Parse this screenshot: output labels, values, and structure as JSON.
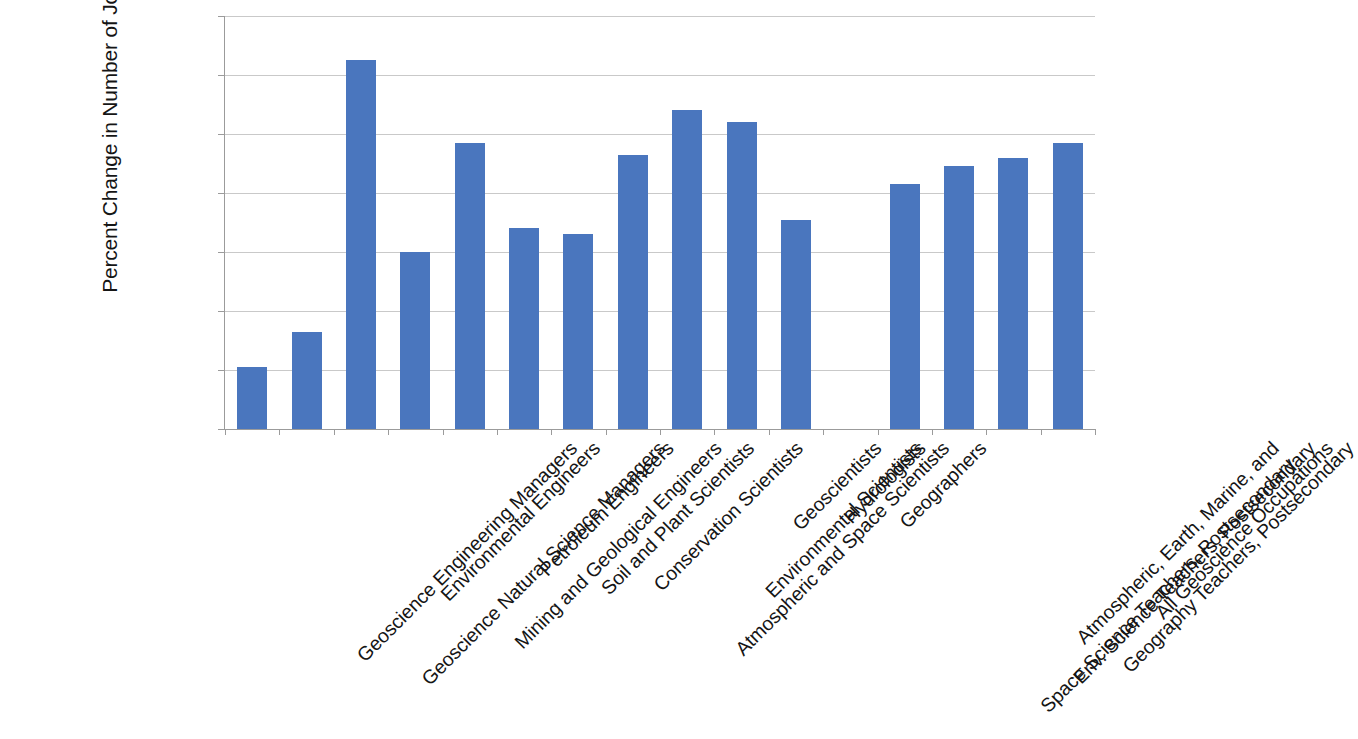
{
  "chart_data": {
    "type": "bar",
    "title": "",
    "xlabel": "",
    "ylabel": "Percent Change in Number of Jobs",
    "ylim": [
      0,
      14
    ],
    "ytick_labels": [
      "14%",
      "12%",
      "10%",
      "8%",
      "6%",
      "4%",
      "2%",
      "0%"
    ],
    "ytick_values": [
      14,
      12,
      10,
      8,
      6,
      4,
      2,
      0
    ],
    "yunit": "%",
    "grid": true,
    "legend": null,
    "bar_color": "#4a76be",
    "gridline_color": "#c9c9c9",
    "axis_color": "#9b9b9b",
    "categories": [
      "Geoscience Engineering Managers",
      "Geoscience Natural Science Managers",
      "Environmental Engineers",
      "Mining and Geological Engineers",
      "Petroleum Engineers",
      "Soil and Plant Scientists",
      "Conservation Scientists",
      "Atmospheric and Space Scientists",
      "Environmental Scientists",
      "Geoscientists",
      "Hydrologists",
      "Geographers",
      "Atmospheric, Earth, Marine, and\nSpace Science Teachers, Postsecondary",
      "Env. Science Teachers, Postsecondary",
      "Geography Teachers, Postsecondary",
      "All Geoscience Occupations"
    ],
    "values": [
      2.1,
      3.3,
      12.5,
      6.0,
      9.7,
      6.8,
      6.6,
      9.3,
      10.8,
      10.4,
      7.1,
      0.0,
      8.3,
      8.9,
      9.2,
      9.7
    ]
  }
}
